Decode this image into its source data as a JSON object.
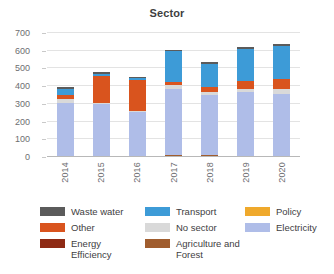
{
  "chart_data": {
    "type": "bar",
    "subtype": "stacked-bar",
    "title": "Sector",
    "xlabel": "",
    "ylabel": "",
    "ylim": [
      0,
      700
    ],
    "ytick_step": 100,
    "yticks": [
      0,
      100,
      200,
      300,
      400,
      500,
      600,
      700
    ],
    "ytick_labels": [
      "0",
      "100",
      "200",
      "300",
      "400",
      "500",
      "600",
      "700"
    ],
    "grid": true,
    "grid_axis": "y",
    "legend_position": "bottom",
    "categories": [
      "2014",
      "2015",
      "2016",
      "2017",
      "2018",
      "2019",
      "2020"
    ],
    "series": [
      {
        "name": "Agriculture and Forest",
        "color": "#A05D2E",
        "values": [
          4,
          4,
          3,
          10,
          9,
          6,
          5
        ]
      },
      {
        "name": "Electricity",
        "color": "#AFBDE8",
        "values": [
          300,
          294,
          250,
          372,
          340,
          360,
          350
        ]
      },
      {
        "name": "No sector",
        "color": "#D9D9D9",
        "values": [
          22,
          6,
          5,
          22,
          18,
          18,
          30
        ]
      },
      {
        "name": "Other",
        "color": "#D9541E",
        "values": [
          22,
          155,
          175,
          20,
          26,
          46,
          55
        ]
      },
      {
        "name": "Transport",
        "color": "#3D9BD7",
        "values": [
          38,
          12,
          12,
          172,
          130,
          180,
          185
        ]
      },
      {
        "name": "Waste water",
        "color": "#5B5B5B",
        "values": [
          9,
          10,
          9,
          10,
          11,
          12,
          12
        ]
      },
      {
        "name": "Energy Efficiency",
        "color": "#8E2A14",
        "values": [
          0,
          0,
          0,
          0,
          0,
          0,
          0
        ]
      },
      {
        "name": "Policy",
        "color": "#EFA92C",
        "values": [
          0,
          0,
          0,
          0,
          0,
          0,
          0
        ]
      }
    ],
    "totals": [
      395,
      481,
      454,
      606,
      534,
      622,
      637
    ]
  },
  "legend": {
    "columns": [
      {
        "items": [
          {
            "label": "Waste water",
            "color": "#5B5B5B"
          },
          {
            "label": "Other",
            "color": "#D9541E"
          },
          {
            "label": "Energy Efficiency",
            "color": "#8E2A14"
          }
        ]
      },
      {
        "items": [
          {
            "label": "Transport",
            "color": "#3D9BD7"
          },
          {
            "label": "No sector",
            "color": "#D9D9D9"
          },
          {
            "label": "Agriculture and Forest",
            "color": "#A05D2E"
          }
        ]
      },
      {
        "items": [
          {
            "label": "Policy",
            "color": "#EFA92C"
          },
          {
            "label": "Electricity",
            "color": "#AFBDE8"
          }
        ]
      }
    ]
  }
}
